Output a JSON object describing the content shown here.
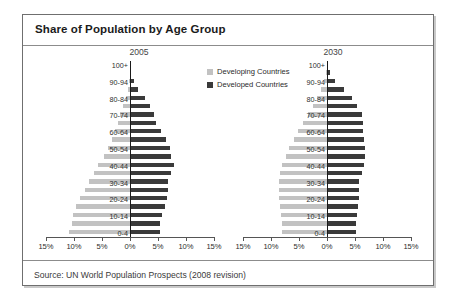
{
  "figure": {
    "title": "Share of Population by Age Group",
    "source": "Source: UN World Population Prospects (2008 revision)"
  },
  "legend": {
    "position": "inside-top-right",
    "items": [
      {
        "label": "Developing Countries",
        "color": "#c2c2c2",
        "key": "developing"
      },
      {
        "label": "Developed Countries",
        "color": "#3a3a3a",
        "key": "developed"
      }
    ]
  },
  "axis": {
    "ticks": [
      "15%",
      "10%",
      "5%",
      "0%",
      "5%",
      "10%",
      "15%"
    ],
    "tick_values": [
      15,
      10,
      5,
      0,
      5,
      10,
      15
    ],
    "max": 15,
    "unit": "%"
  },
  "age_groups": [
    "0-4",
    "5-9",
    "10-14",
    "15-19",
    "20-24",
    "25-29",
    "30-34",
    "35-39",
    "40-44",
    "45-49",
    "50-54",
    "55-59",
    "60-64",
    "65-69",
    "70-74",
    "75-79",
    "80-84",
    "85-89",
    "90-94",
    "95-99",
    "100+"
  ],
  "age_labels_shown": [
    "0-4",
    "10-14",
    "20-24",
    "30-34",
    "40-44",
    "50-54",
    "60-64",
    "70-74",
    "80-84",
    "90-94",
    "100+"
  ],
  "panels": [
    {
      "key": "p2005",
      "year": "2005"
    },
    {
      "key": "p2030",
      "year": "2030"
    }
  ],
  "chart_data": {
    "type": "bar",
    "subtype": "population-pyramid",
    "title": "Share of Population by Age Group",
    "xlabel": "",
    "ylabel": "",
    "xlim": [
      -15,
      15
    ],
    "xticks": [
      -15,
      -10,
      -5,
      0,
      5,
      10,
      15
    ],
    "xticklabels": [
      "15%",
      "10%",
      "5%",
      "0%",
      "5%",
      "10%",
      "15%"
    ],
    "grid": false,
    "legend": [
      "Developing Countries",
      "Developed Countries"
    ],
    "legend_position": "upper right",
    "categories": [
      "0-4",
      "5-9",
      "10-14",
      "15-19",
      "20-24",
      "25-29",
      "30-34",
      "35-39",
      "40-44",
      "45-49",
      "50-54",
      "55-59",
      "60-64",
      "65-69",
      "70-74",
      "75-79",
      "80-84",
      "85-89",
      "90-94",
      "95-99",
      "100+"
    ],
    "panels": [
      {
        "name": "2005",
        "series": [
          {
            "name": "Developing Countries",
            "direction": "left",
            "color": "#c2c2c2",
            "values": [
              10.9,
              10.4,
              10.1,
              9.6,
              8.9,
              8.1,
              7.3,
              6.5,
              5.7,
              4.7,
              4.0,
              3.2,
              2.6,
              2.1,
              1.7,
              1.2,
              0.8,
              0.4,
              0.2,
              0.05,
              0.01
            ]
          },
          {
            "name": "Developed Countries",
            "direction": "right",
            "color": "#3a3a3a",
            "values": [
              5.3,
              5.3,
              5.7,
              6.2,
              6.6,
              6.7,
              6.7,
              7.3,
              7.8,
              7.4,
              7.2,
              6.5,
              5.5,
              4.6,
              4.3,
              3.5,
              2.6,
              1.5,
              0.7,
              0.2,
              0.03
            ]
          }
        ]
      },
      {
        "name": "2030",
        "series": [
          {
            "name": "Developing Countries",
            "direction": "left",
            "color": "#c2c2c2",
            "values": [
              8.0,
              8.1,
              8.3,
              8.4,
              8.5,
              8.6,
              8.6,
              8.4,
              8.0,
              7.4,
              6.7,
              5.9,
              5.1,
              4.3,
              3.4,
              2.5,
              1.7,
              1.0,
              0.5,
              0.15,
              0.02
            ]
          },
          {
            "name": "Developed Countries",
            "direction": "right",
            "color": "#3a3a3a",
            "values": [
              5.1,
              5.2,
              5.4,
              5.6,
              5.8,
              5.8,
              5.8,
              6.2,
              6.6,
              6.8,
              6.8,
              6.6,
              6.5,
              6.4,
              6.2,
              5.4,
              4.4,
              3.1,
              1.5,
              0.6,
              0.1
            ]
          }
        ]
      }
    ]
  }
}
